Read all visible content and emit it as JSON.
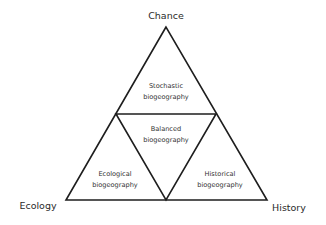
{
  "diagram": {
    "type": "ternary-triangle",
    "vertices": {
      "top": {
        "label": "Chance"
      },
      "bottom_left": {
        "label": "Ecology"
      },
      "bottom_right": {
        "label": "History"
      }
    },
    "regions": {
      "top": {
        "line1": "Stochastic",
        "line2": "biogeography"
      },
      "center": {
        "line1": "Balanced",
        "line2": "biogeography"
      },
      "bottom_left": {
        "line1": "Ecological",
        "line2": "biogeography"
      },
      "bottom_right": {
        "line1": "Historical",
        "line2": "biogeography"
      }
    },
    "colors": {
      "line": "#1e1e1e",
      "text": "#2a2a2a",
      "background": "#ffffff"
    }
  }
}
